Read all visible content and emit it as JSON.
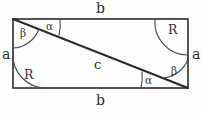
{
  "figure": {
    "shape": "rectangle",
    "colors": {
      "background": "#fefefe",
      "stroke": "#2b2b2b",
      "arc_stroke": "#4a4a4a"
    },
    "rect": {
      "x": 13,
      "y": 19,
      "width": 175,
      "height": 69
    },
    "diagonal": {
      "x1": 13,
      "y1": 19,
      "x2": 188,
      "y2": 88
    },
    "labels": {
      "side_top": "b",
      "side_bottom": "b",
      "side_left": "a",
      "side_right": "a",
      "diagonal": "c",
      "angle_alpha_top": "α",
      "angle_beta_top": "β",
      "angle_alpha_bottom": "α",
      "angle_beta_bottom": "β",
      "right_angle_top_right": "R",
      "right_angle_bottom_left": "R"
    },
    "annotations": [
      {
        "name": "side-label-top",
        "text": "b",
        "x": 96,
        "y": 7,
        "kind": "side"
      },
      {
        "name": "side-label-bottom",
        "text": "b",
        "x": 96,
        "y": 99,
        "kind": "side"
      },
      {
        "name": "side-label-left",
        "text": "a",
        "x": 5,
        "y": 53,
        "kind": "side"
      },
      {
        "name": "side-label-right",
        "text": "a",
        "x": 194,
        "y": 53,
        "kind": "side"
      },
      {
        "name": "diagonal-label",
        "text": "c",
        "x": 97,
        "y": 64,
        "kind": "diagonal"
      },
      {
        "name": "angle-label-alpha-top",
        "text": "α",
        "x": 49,
        "y": 26,
        "kind": "angle"
      },
      {
        "name": "angle-label-beta-top",
        "text": "β",
        "x": 23,
        "y": 33,
        "kind": "angle"
      },
      {
        "name": "angle-label-alpha-bottom",
        "text": "α",
        "x": 148,
        "y": 80,
        "kind": "angle"
      },
      {
        "name": "angle-label-beta-bottom",
        "text": "β",
        "x": 174,
        "y": 72,
        "kind": "angle"
      },
      {
        "name": "right-angle-label-top-right",
        "text": "R",
        "x": 172,
        "y": 30,
        "kind": "right"
      },
      {
        "name": "right-angle-label-bottom-left",
        "text": "R",
        "x": 27,
        "y": 75,
        "kind": "right"
      }
    ]
  }
}
